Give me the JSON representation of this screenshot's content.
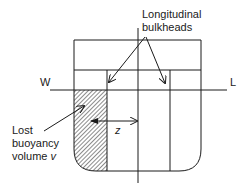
{
  "labels": {
    "longitudinal_line1": "Longitudinal",
    "longitudinal_line2": "bulkheads",
    "waterline_left": "W",
    "waterline_right": "L",
    "lost_line1": "Lost",
    "lost_line2": "buoyancy",
    "lost_line3_prefix": "volume ",
    "lost_line3_var": "v",
    "lever_arm": "z"
  },
  "colors": {
    "stroke": "#1a1a1a",
    "background": "#ffffff"
  }
}
